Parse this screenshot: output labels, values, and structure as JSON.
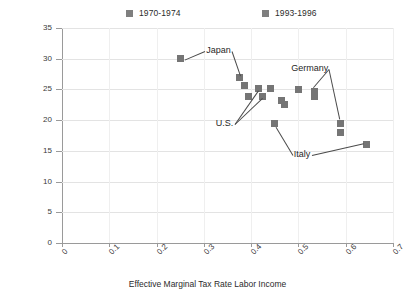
{
  "chart_data": {
    "type": "scatter",
    "title": "",
    "xlabel": "Effective Marginal Tax Rate Labor Income",
    "ylabel": "Hours per Week per Person",
    "xlim": [
      0,
      0.7
    ],
    "ylim": [
      0,
      35
    ],
    "xticks": [
      "0",
      "0.1",
      "0.2",
      "0.3",
      "0.4",
      "0.5",
      "0.6",
      "0.7"
    ],
    "yticks": [
      "0",
      "5",
      "10",
      "15",
      "20",
      "25",
      "30",
      "35"
    ],
    "grid": "horizontal",
    "legend_position": "top",
    "marker_color": "#757575",
    "series": [
      {
        "name": "1970-1974",
        "points": [
          {
            "x": 0.25,
            "y": 30.0
          },
          {
            "x": 0.375,
            "y": 27.0
          },
          {
            "x": 0.415,
            "y": 25.2
          },
          {
            "x": 0.425,
            "y": 23.9
          },
          {
            "x": 0.44,
            "y": 25.2
          },
          {
            "x": 0.465,
            "y": 23.2
          },
          {
            "x": 0.5,
            "y": 25.0
          },
          {
            "x": 0.535,
            "y": 24.6
          },
          {
            "x": 0.59,
            "y": 19.5
          }
        ]
      },
      {
        "name": "1993-1996",
        "points": [
          {
            "x": 0.385,
            "y": 25.7
          },
          {
            "x": 0.395,
            "y": 23.8
          },
          {
            "x": 0.47,
            "y": 22.6
          },
          {
            "x": 0.45,
            "y": 19.5
          },
          {
            "x": 0.535,
            "y": 23.8
          },
          {
            "x": 0.59,
            "y": 18.0
          },
          {
            "x": 0.645,
            "y": 16.0
          }
        ]
      }
    ],
    "annotations": [
      {
        "label": "Japan",
        "label_x": 0.305,
        "label_y": 31.3,
        "leaders": [
          {
            "to_x": 0.26,
            "to_y": 29.9
          },
          {
            "to_x": 0.378,
            "to_y": 27.3
          }
        ]
      },
      {
        "label": "U.S.",
        "label_x": 0.325,
        "label_y": 19.4,
        "leaders": [
          {
            "to_x": 0.415,
            "to_y": 24.9
          },
          {
            "to_x": 0.424,
            "to_y": 23.7
          }
        ]
      },
      {
        "label": "Germany",
        "label_x": 0.485,
        "label_y": 28.3,
        "leaders": [
          {
            "to_x": 0.532,
            "to_y": 25.3
          },
          {
            "to_x": 0.588,
            "to_y": 20.2
          }
        ]
      },
      {
        "label": "Italy",
        "label_x": 0.49,
        "label_y": 14.4,
        "leaders": [
          {
            "to_x": 0.452,
            "to_y": 19.0
          },
          {
            "to_x": 0.637,
            "to_y": 16.3
          }
        ]
      }
    ]
  }
}
